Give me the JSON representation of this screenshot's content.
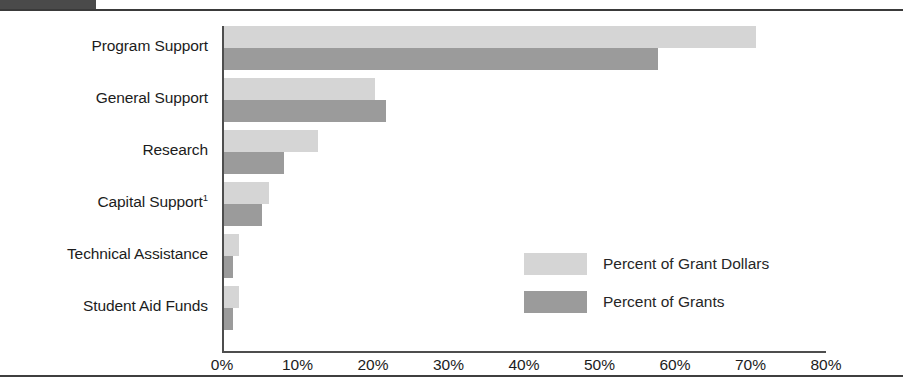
{
  "chart_data": {
    "type": "bar",
    "orientation": "horizontal",
    "title": "",
    "xlabel": "",
    "ylabel": "",
    "xlim": [
      0,
      80
    ],
    "xtick_labels": [
      "0%",
      "10%",
      "20%",
      "30%",
      "40%",
      "50%",
      "60%",
      "70%",
      "80%"
    ],
    "xtick_values": [
      0,
      10,
      20,
      30,
      40,
      50,
      60,
      70,
      80
    ],
    "grid": false,
    "legend_position": "center-right",
    "categories": [
      "Program Support",
      "General Support",
      "Research",
      "Capital Support",
      "Technical Assistance",
      "Student Aid Funds"
    ],
    "category_labels": [
      "Program Support",
      "General Support",
      "Research",
      "Capital Support",
      "Technical Assistance",
      "Student Aid Funds"
    ],
    "category_footnote_marks": [
      "",
      "",
      "",
      "1",
      "",
      ""
    ],
    "series": [
      {
        "name": "Percent of Grant Dollars",
        "color": "#d5d5d5",
        "values": [
          70.5,
          20.0,
          12.5,
          6.0,
          2.0,
          2.0
        ]
      },
      {
        "name": "Percent of Grants",
        "color": "#9b9b9b",
        "values": [
          57.5,
          21.5,
          8.0,
          5.0,
          1.2,
          1.2
        ]
      }
    ]
  },
  "legend": {
    "items": [
      {
        "label": "Percent of Grant Dollars",
        "color": "#d5d5d5"
      },
      {
        "label": "Percent of Grants",
        "color": "#9b9b9b"
      }
    ]
  },
  "colors": {
    "dollars": "#d5d5d5",
    "grants": "#9b9b9b",
    "axis": "#4e4e4e",
    "rule": "#3a3a3a",
    "header_tab": "#4a4a4a",
    "text": "#1c1c1c"
  }
}
